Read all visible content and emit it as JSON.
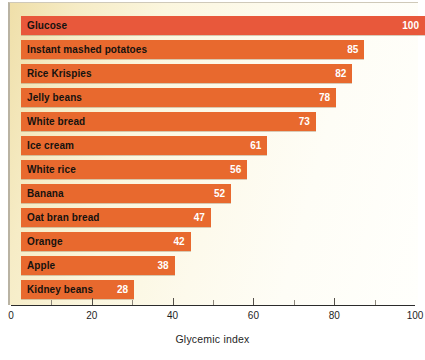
{
  "chart_data": {
    "type": "bar",
    "orientation": "horizontal",
    "title": "",
    "xlabel": "Glycemic index",
    "ylabel": "",
    "xlim": [
      0,
      100
    ],
    "xticks": [
      0,
      20,
      40,
      60,
      80,
      100
    ],
    "xtick_labels": [
      "0",
      "20",
      "40",
      "60",
      "80",
      "100"
    ],
    "minor_ticks": [
      10,
      30,
      50,
      70,
      90
    ],
    "grid": false,
    "legend": null,
    "categories": [
      "Glucose",
      "Instant mashed potatoes",
      "Rice Krispies",
      "Jelly beans",
      "White bread",
      "Ice cream",
      "White rice",
      "Banana",
      "Oat bran bread",
      "Orange",
      "Apple",
      "Kidney beans"
    ],
    "values": [
      100,
      85,
      82,
      78,
      73,
      61,
      56,
      52,
      47,
      42,
      38,
      28
    ],
    "value_labels": [
      "100",
      "85",
      "82",
      "78",
      "73",
      "61",
      "56",
      "52",
      "47",
      "42",
      "38",
      "28"
    ],
    "colors": {
      "bar": "#e8692e",
      "bar_highlight": "#e8583b",
      "value_label": "#ffffff",
      "category_label": "#15120f",
      "panel_background_left": "#efdfa9",
      "panel_background_right": "#fffffc",
      "axis": "#2b2b2b"
    }
  }
}
